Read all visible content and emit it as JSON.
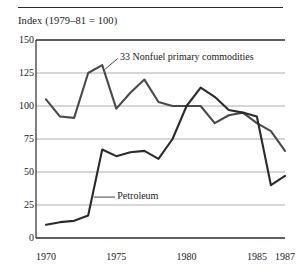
{
  "figure": {
    "axis_title": "Index (1979–81 = 100)",
    "annotations": {
      "nonfuel": "33 Nonfuel primary commodities",
      "petroleum": "Petroleum"
    }
  },
  "chart_data": {
    "type": "line",
    "title": "",
    "subtitle": "",
    "xlabel": "",
    "ylabel": "Index (1979–81 = 100)",
    "xlim": [
      1970,
      1987
    ],
    "ylim": [
      0,
      150
    ],
    "grid": true,
    "legend_position": "inline-annotation",
    "yticks": [
      0,
      25,
      50,
      75,
      100,
      125,
      150
    ],
    "ytick_labels": [
      "0",
      "25",
      "50",
      "75",
      "100",
      "125",
      "150"
    ],
    "xticks": [
      1970,
      1975,
      1980,
      1985,
      1987
    ],
    "xtick_labels": [
      "1970",
      "1975",
      "1980",
      "1985",
      "1987"
    ],
    "x": [
      1970,
      1971,
      1972,
      1973,
      1974,
      1975,
      1976,
      1977,
      1978,
      1979,
      1980,
      1981,
      1982,
      1983,
      1984,
      1985,
      1986,
      1987
    ],
    "series": [
      {
        "name": "33 Nonfuel primary commodities",
        "color": "#4a4a4a",
        "values": [
          105,
          92,
          91,
          125,
          131,
          98,
          110,
          120,
          103,
          100,
          100,
          100,
          87,
          93,
          95,
          87,
          81,
          66
        ]
      },
      {
        "name": "Petroleum",
        "color": "#2b2b2b",
        "values": [
          10,
          12,
          13,
          17,
          67,
          62,
          65,
          66,
          60,
          75,
          100,
          114,
          107,
          97,
          95,
          92,
          40,
          47
        ]
      }
    ],
    "annotations": [
      {
        "text": "33 Nonfuel primary commodities",
        "series": "33 Nonfuel primary commodities",
        "points_to_year": 1974
      },
      {
        "text": "Petroleum",
        "series": "Petroleum",
        "points_to_year": 1973
      }
    ]
  }
}
